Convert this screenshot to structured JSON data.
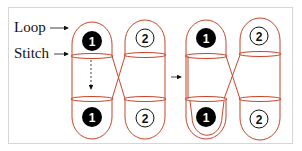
{
  "labels": {
    "loop": "Loop",
    "stitch": "Stitch"
  },
  "colors": {
    "yarn": "#c8442a",
    "frame_border": "#d6d6d6",
    "filled_disc": "#000000",
    "text": "#111111"
  },
  "groups": [
    {
      "name": "before",
      "loops": [
        {
          "number": "1",
          "style": "filled-black",
          "position": "top"
        },
        {
          "number": "2",
          "style": "outlined",
          "position": "top"
        },
        {
          "number": "1",
          "style": "filled-black",
          "position": "bottom"
        },
        {
          "number": "2",
          "style": "outlined",
          "position": "bottom"
        }
      ]
    },
    {
      "name": "after",
      "loops": [
        {
          "number": "1",
          "style": "filled-black",
          "position": "top"
        },
        {
          "number": "2",
          "style": "outlined",
          "position": "top"
        },
        {
          "number": "1",
          "style": "filled-black",
          "position": "bottom"
        },
        {
          "number": "2",
          "style": "outlined",
          "position": "bottom"
        }
      ]
    }
  ],
  "numbers": {
    "g1_top_1": "1",
    "g1_top_2": "2",
    "g1_bot_1": "1",
    "g1_bot_2": "2",
    "g2_top_1": "1",
    "g2_top_2": "2",
    "g2_bot_1": "1",
    "g2_bot_2": "2"
  }
}
